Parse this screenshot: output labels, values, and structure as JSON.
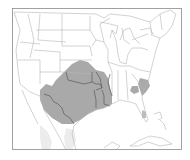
{
  "map": {
    "type": "species-range-map",
    "region": "United States and Mexico",
    "colors": {
      "background": "#ffffff",
      "frame": "#8a8a8a",
      "borders": "#b5b5b5",
      "range_fill": "#a9a9a9",
      "secondary_fill": "#e6e6e6",
      "range_outline_border": "#555555"
    },
    "legend": [],
    "range_areas": [
      "Southern Great Plains (Texas, Oklahoma, Arkansas, Louisiana, eastern New Mexico)",
      "South Carolina / Georgia coastal plain",
      "Central Georgia"
    ]
  }
}
